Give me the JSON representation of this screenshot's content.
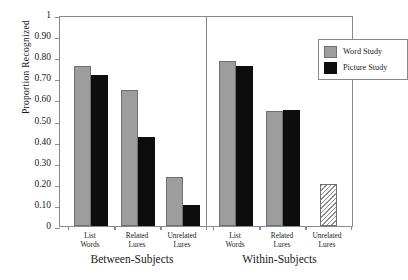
{
  "chart_data": {
    "type": "bar",
    "title": "",
    "subtitle": "",
    "xlabel": "",
    "ylabel": "Proportion Recognized",
    "ylim": [
      0,
      1
    ],
    "grid": false,
    "legend_position": "top-right",
    "y_ticks": [
      {
        "value": 1,
        "label": "1"
      },
      {
        "value": 0.9,
        "label": "0.90"
      },
      {
        "value": 0.8,
        "label": "0.80"
      },
      {
        "value": 0.7,
        "label": "0.70"
      },
      {
        "value": 0.6,
        "label": "0.60"
      },
      {
        "value": 0.5,
        "label": "0.50"
      },
      {
        "value": 0.4,
        "label": "0.40"
      },
      {
        "value": 0.3,
        "label": "0.30"
      },
      {
        "value": 0.2,
        "label": "0.20"
      },
      {
        "value": 0.1,
        "label": "0.10"
      },
      {
        "value": 0,
        "label": "0"
      }
    ],
    "panels": [
      {
        "label": "Between-Subjects",
        "categories": [
          "List Words",
          "Related Lures",
          "Unrelated Lures"
        ],
        "bars": [
          [
            {
              "series": "Word Study",
              "value": 0.76,
              "style": "gray"
            },
            {
              "series": "Picture Study",
              "value": 0.715,
              "style": "black"
            }
          ],
          [
            {
              "series": "Word Study",
              "value": 0.645,
              "style": "gray"
            },
            {
              "series": "Picture Study",
              "value": 0.42,
              "style": "black"
            }
          ],
          [
            {
              "series": "Word Study",
              "value": 0.23,
              "style": "gray"
            },
            {
              "series": "Picture Study",
              "value": 0.1,
              "style": "black"
            }
          ]
        ]
      },
      {
        "label": "Within-Subjects",
        "categories": [
          "List Words",
          "Related Lures",
          "Unrelated Lures"
        ],
        "bars": [
          [
            {
              "series": "Word Study",
              "value": 0.78,
              "style": "gray"
            },
            {
              "series": "Picture Study",
              "value": 0.76,
              "style": "black"
            }
          ],
          [
            {
              "series": "Word Study",
              "value": 0.545,
              "style": "gray"
            },
            {
              "series": "Picture Study",
              "value": 0.552,
              "style": "black"
            }
          ],
          [
            {
              "series": "Combined",
              "value": 0.2,
              "style": "hatch"
            }
          ]
        ]
      }
    ],
    "legend": [
      {
        "label": "Word Study",
        "style": "gray",
        "color": "#9d9d9d"
      },
      {
        "label": "Picture Study",
        "style": "black",
        "color": "#0d0d0d"
      }
    ],
    "category_labels_wrapped": [
      [
        "List",
        "Words"
      ],
      [
        "Related",
        "Lures"
      ],
      [
        "Unrelated",
        "Lures"
      ]
    ]
  }
}
